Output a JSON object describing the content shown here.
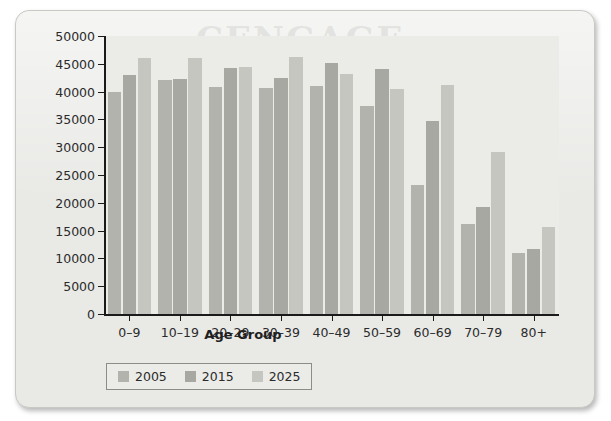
{
  "figure": {
    "watermark": "CENGAGE"
  },
  "chart_data": {
    "type": "bar",
    "title": "",
    "xlabel": "Age Group",
    "ylabel": "Population (000s)",
    "categories": [
      "0–9",
      "10–19",
      "20–29",
      "30–39",
      "40–49",
      "50–59",
      "60–69",
      "70–79",
      "80+"
    ],
    "series": [
      {
        "name": "2005",
        "color": "#b3b3ae",
        "values": [
          40000,
          42000,
          40800,
          40700,
          41000,
          37500,
          23200,
          16100,
          10900
        ]
      },
      {
        "name": "2015",
        "color": "#a8a8a3",
        "values": [
          43000,
          42300,
          44200,
          42400,
          45200,
          44000,
          34800,
          19200,
          11700
        ]
      },
      {
        "name": "2025",
        "color": "#c6c6c1",
        "values": [
          46000,
          46000,
          44500,
          46300,
          43200,
          40500,
          41200,
          29100,
          15700
        ]
      }
    ],
    "ylim": [
      0,
      50000
    ],
    "yticks": [
      0,
      5000,
      10000,
      15000,
      20000,
      25000,
      30000,
      35000,
      40000,
      45000,
      50000
    ],
    "ytick_labels": [
      "0",
      "5000",
      "10000",
      "15000",
      "20000",
      "25000",
      "30000",
      "35000",
      "40000",
      "45000",
      "50000"
    ],
    "grid": false,
    "legend_position": "below-left",
    "plot_background": "#ebebe8",
    "axis_color": "#1a1a1a"
  }
}
